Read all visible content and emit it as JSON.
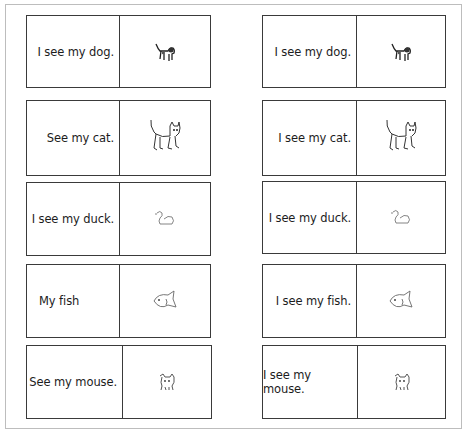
{
  "worksheet": {
    "left_column": [
      {
        "text": "I see my dog.",
        "picture": "dog-icon"
      },
      {
        "text": "See my cat.",
        "picture": "cat-icon"
      },
      {
        "text": "I see my duck.",
        "picture": "duck-icon"
      },
      {
        "text": "My fish",
        "picture": "fish-icon"
      },
      {
        "text": "See my mouse.",
        "picture": "mouse-icon"
      }
    ],
    "right_column": [
      {
        "text": "I see my dog.",
        "picture": "dog-icon"
      },
      {
        "text": "I see my cat.",
        "picture": "cat-icon"
      },
      {
        "text": "I see my duck.",
        "picture": "duck-icon"
      },
      {
        "text": "I see my fish.",
        "picture": "fish-icon"
      },
      {
        "text": "I see my mouse.",
        "picture": "mouse-icon"
      }
    ]
  },
  "colors": {
    "card_border": "#3a3a3a",
    "frame_border": "#bdbdbd",
    "text": "#1c1c1c"
  }
}
